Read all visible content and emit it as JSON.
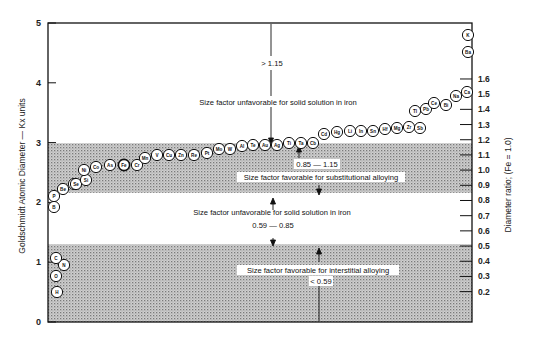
{
  "chart_data": {
    "type": "scatter",
    "title": "",
    "ylabel": "Goldschmidt Atomic Diameter — Kx units",
    "ylabel_right": "Diameter ratio; (Fe = 1.0)",
    "xlabel": "",
    "ylim": [
      0,
      5
    ],
    "ylim_right": [
      0,
      1.9
    ],
    "left_ticks": [
      "0",
      "1",
      "2",
      "3",
      "4",
      "5"
    ],
    "right_ticks": [
      "0.2",
      "0.3",
      "0.4",
      "0.5",
      "0.6",
      "0.7",
      "0.8",
      "0.9",
      "1.0",
      "1.1",
      "1.2",
      "1.3",
      "1.4",
      "1.5",
      "1.6"
    ],
    "grid": false,
    "bands": [
      {
        "from": 0.0,
        "to": 1.3,
        "shaded": true,
        "label": "Size factor favorable for interstitial alloying",
        "range": "< 0.59"
      },
      {
        "from": 1.3,
        "to": 2.16,
        "shaded": false,
        "label": "Size factor unfavorable for solid solution in iron",
        "range": "0.59 — 0.85"
      },
      {
        "from": 2.16,
        "to": 2.99,
        "shaded": true,
        "label": "Size factor favorable for substitutional alloying",
        "range": "0.85 — 1.15"
      },
      {
        "from": 2.99,
        "to": 5.0,
        "shaded": false,
        "label": "Size factor unfavorable for solid solution in iron",
        "range": "> 1.15"
      }
    ],
    "elements": [
      {
        "symbol": "H",
        "diameter": 0.92
      },
      {
        "symbol": "O",
        "diameter": 1.2
      },
      {
        "symbol": "N",
        "diameter": 1.42
      },
      {
        "symbol": "C",
        "diameter": 1.54
      },
      {
        "symbol": "B",
        "diameter": 1.94
      },
      {
        "symbol": "P",
        "diameter": 2.18
      },
      {
        "symbol": "S",
        "diameter": 2.3
      },
      {
        "symbol": "Be",
        "diameter": 2.25
      },
      {
        "symbol": "Se",
        "diameter": 2.32
      },
      {
        "symbol": "Si",
        "diameter": 2.35
      },
      {
        "symbol": "Ni",
        "diameter": 2.49
      },
      {
        "symbol": "Co",
        "diameter": 2.51
      },
      {
        "symbol": "As",
        "diameter": 2.5
      },
      {
        "symbol": "Fe",
        "diameter": 2.54
      },
      {
        "symbol": "Cr",
        "diameter": 2.57
      },
      {
        "symbol": "Mn",
        "diameter": 2.64
      },
      {
        "symbol": "V",
        "diameter": 2.69
      },
      {
        "symbol": "Cu",
        "diameter": 2.71
      },
      {
        "symbol": "Zn",
        "diameter": 2.74
      },
      {
        "symbol": "Re",
        "diameter": 2.75
      },
      {
        "symbol": "Pt",
        "diameter": 2.77
      },
      {
        "symbol": "Mo",
        "diameter": 2.8
      },
      {
        "symbol": "W",
        "diameter": 2.82
      },
      {
        "symbol": "Al",
        "diameter": 2.86
      },
      {
        "symbol": "Te",
        "diameter": 2.86
      },
      {
        "symbol": "Au",
        "diameter": 2.88
      },
      {
        "symbol": "Ag",
        "diameter": 2.88
      },
      {
        "symbol": "Ti",
        "diameter": 2.93
      },
      {
        "symbol": "Ta",
        "diameter": 2.94
      },
      {
        "symbol": "Cb",
        "diameter": 2.95
      },
      {
        "symbol": "Cd",
        "diameter": 3.04
      },
      {
        "symbol": "Hg",
        "diameter": 3.1
      },
      {
        "symbol": "Li",
        "diameter": 3.12
      },
      {
        "symbol": "In",
        "diameter": 3.14
      },
      {
        "symbol": "Sn",
        "diameter": 3.16
      },
      {
        "symbol": "Hf",
        "diameter": 3.17
      },
      {
        "symbol": "Mg",
        "diameter": 3.2
      },
      {
        "symbol": "Zr",
        "diameter": 3.2
      },
      {
        "symbol": "Sb",
        "diameter": 3.23
      },
      {
        "symbol": "Tl",
        "diameter": 3.42
      },
      {
        "symbol": "Pb",
        "diameter": 3.5
      },
      {
        "symbol": "Ce",
        "diameter": 3.62
      },
      {
        "symbol": "Bi",
        "diameter": 3.64
      },
      {
        "symbol": "Na",
        "diameter": 3.82
      },
      {
        "symbol": "Ca",
        "diameter": 3.94
      },
      {
        "symbol": "Ba",
        "diameter": 4.48
      },
      {
        "symbol": "K",
        "diameter": 4.76
      }
    ]
  },
  "labels": {
    "left_axis_title": "Goldschmidt Atomic Diameter — Kx units",
    "right_axis_title": "Diameter ratio; (Fe = 1.0)",
    "ann_gt": "> 1.15",
    "ann_unfav_top": "Size factor unfavorable for solid solution in iron",
    "ann_sub_range": "0.85 — 1.15",
    "ann_sub": "Size factor favorable for substitutional alloying",
    "ann_unfav_mid": "Size factor unfavorable for solid solution in iron",
    "ann_mid_range": "0.59 — 0.85",
    "ann_int": "Size factor favorable for interstitial alloying",
    "ann_int_range": "< 0.59"
  }
}
